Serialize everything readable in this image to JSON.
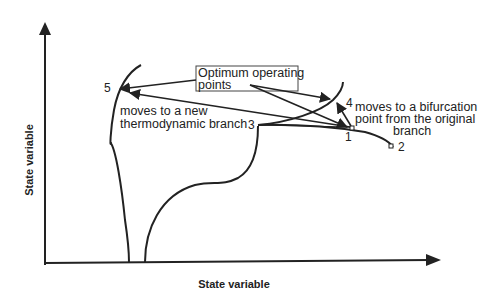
{
  "diagram": {
    "x_axis_label": "State variable",
    "y_axis_label": "State variable",
    "callout": {
      "line1": "Optimum operating",
      "line2": "points"
    },
    "annotations": {
      "new_branch_line1": "moves to a new",
      "new_branch_line2": "thermodynamic branch",
      "bifurcation_line1": "moves to a bifurcation",
      "bifurcation_line2": "point from the original",
      "bifurcation_line3": "branch"
    },
    "points": [
      {
        "id": "1",
        "label": "1"
      },
      {
        "id": "2",
        "label": "2"
      },
      {
        "id": "3",
        "label": "3"
      },
      {
        "id": "4",
        "label": "4"
      },
      {
        "id": "5",
        "label": "5"
      }
    ],
    "colors": {
      "ink": "#222222",
      "background": "#ffffff"
    }
  }
}
